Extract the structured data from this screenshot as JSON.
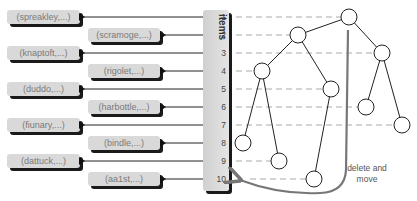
{
  "items_column": {
    "title": "items",
    "indices": [
      "1",
      "2",
      "3",
      "4",
      "5",
      "6",
      "7",
      "8",
      "9",
      "10"
    ]
  },
  "records": [
    {
      "label": "(spreakley,...)",
      "row": 1,
      "column": "left"
    },
    {
      "label": "(scramoge,...)",
      "row": 2,
      "column": "right"
    },
    {
      "label": "(knaptoft,...)",
      "row": 3,
      "column": "left"
    },
    {
      "label": "(rigolet,...)",
      "row": 4,
      "column": "right"
    },
    {
      "label": "(duddo,...)",
      "row": 5,
      "column": "left"
    },
    {
      "label": "(harbottle,...)",
      "row": 6,
      "column": "right"
    },
    {
      "label": "(fiunary,...)",
      "row": 7,
      "column": "left"
    },
    {
      "label": "(bindle,...)",
      "row": 8,
      "column": "right"
    },
    {
      "label": "(dattuck,...)",
      "row": 9,
      "column": "left"
    },
    {
      "label": "(aa1st,...)",
      "row": 10,
      "column": "right"
    }
  ],
  "tree": {
    "nodes": [
      {
        "row": 1,
        "cx": 349,
        "cy": 17
      },
      {
        "row": 2,
        "cx": 298,
        "cy": 35
      },
      {
        "row": 3,
        "cx": 382,
        "cy": 53
      },
      {
        "row": 4,
        "cx": 262,
        "cy": 71
      },
      {
        "row": 5,
        "cx": 331,
        "cy": 89
      },
      {
        "row": 6,
        "cx": 366,
        "cy": 107
      },
      {
        "row": 7,
        "cx": 402,
        "cy": 125
      },
      {
        "row": 8,
        "cx": 243,
        "cy": 143
      },
      {
        "row": 9,
        "cx": 279,
        "cy": 161
      },
      {
        "row": 10,
        "cx": 314,
        "cy": 179
      }
    ],
    "edges": [
      [
        1,
        2
      ],
      [
        1,
        3
      ],
      [
        2,
        4
      ],
      [
        2,
        5
      ],
      [
        3,
        6
      ],
      [
        3,
        7
      ],
      [
        4,
        8
      ],
      [
        4,
        9
      ],
      [
        5,
        10
      ]
    ]
  },
  "annotation": {
    "line1": "delete and",
    "line2": "move"
  },
  "colors": {
    "record_fill": "#d9d9d9",
    "record_text": "#7a7a7a",
    "shadow": "#1a1a1a",
    "dash": "#aaaaaa",
    "move_arrow": "#777777"
  }
}
